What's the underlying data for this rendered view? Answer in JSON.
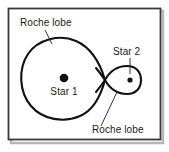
{
  "figure": {
    "background_color": "#ffffff",
    "frame": {
      "border_color": "#3a3a3a",
      "shadow_color": "#b8b8b8",
      "x": 8,
      "y": 8,
      "width": 152,
      "height": 132
    },
    "curve": {
      "stroke_color": "#111111",
      "stroke_width": 2.0,
      "description": "figure-eight Roche equipotential with inner Lagrange crossing point"
    },
    "leader_line": {
      "stroke_color": "#333333",
      "stroke_width": 1.0
    },
    "labels": [
      {
        "id": "roche-lobe-top",
        "text": "Roche lobe",
        "x": 20,
        "y": 26,
        "anchor": "start",
        "leader": {
          "x1": 45,
          "y1": 30,
          "x2": 52,
          "y2": 44
        }
      },
      {
        "id": "star-1",
        "text": "Star 1",
        "x": 64,
        "y": 95,
        "anchor": "middle",
        "leader": null
      },
      {
        "id": "star-2",
        "text": "Star 2",
        "x": 113,
        "y": 55,
        "anchor": "start",
        "leader": {
          "x1": 130,
          "y1": 58,
          "x2": 130,
          "y2": 74
        }
      },
      {
        "id": "roche-lobe-bottom",
        "text": "Roche lobe",
        "x": 92,
        "y": 133,
        "anchor": "start",
        "leader": {
          "x1": 101,
          "y1": 126,
          "x2": 117,
          "y2": 92
        }
      }
    ],
    "stars": [
      {
        "id": "star-1-dot",
        "cx": 64,
        "cy": 78,
        "r": 4.3,
        "color": "#111111"
      },
      {
        "id": "star-2-dot",
        "cx": 130,
        "cy": 80,
        "r": 2.6,
        "color": "#111111"
      }
    ],
    "geometry": {
      "primary_lobe": {
        "left_x": 24,
        "top_y": 38,
        "bottom_y": 119,
        "center_x": 64,
        "center_y": 78
      },
      "secondary_lobe": {
        "right_x": 141,
        "top_y": 66,
        "bottom_y": 94,
        "center_x": 130,
        "center_y": 80
      },
      "lagrange_point": {
        "x": 105,
        "y": 80
      }
    }
  }
}
